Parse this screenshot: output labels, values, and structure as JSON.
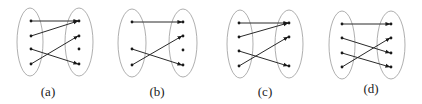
{
  "figure": {
    "width": 422,
    "height": 104,
    "colors": {
      "ellipse": "#9a9a9a",
      "edge": "#2a2a2a",
      "dot": "#1a1a1a",
      "label": "#222222"
    },
    "panels": [
      {
        "id": "a",
        "label": "(a)",
        "label_pos": [
          48,
          96
        ],
        "left_ellipse": {
          "cx": 30,
          "cy": 42,
          "rx": 13,
          "ry": 34
        },
        "right_ellipse": {
          "cx": 79,
          "cy": 42,
          "rx": 14,
          "ry": 34
        },
        "left_points": [
          [
            31,
            21
          ],
          [
            31,
            36
          ],
          [
            31,
            49
          ],
          [
            31,
            64
          ]
        ],
        "right_points": [
          [
            79,
            21
          ],
          [
            79,
            36
          ],
          [
            79,
            49
          ],
          [
            79,
            64
          ]
        ],
        "mapping": [
          [
            0,
            0
          ],
          [
            1,
            0
          ],
          [
            2,
            3
          ],
          [
            3,
            1
          ]
        ]
      },
      {
        "id": "b",
        "label": "(b)",
        "label_pos": [
          157,
          96
        ],
        "left_ellipse": {
          "cx": 132,
          "cy": 43,
          "rx": 14,
          "ry": 34
        },
        "right_ellipse": {
          "cx": 183,
          "cy": 43,
          "rx": 14,
          "ry": 34
        },
        "left_points": [
          [
            132,
            22
          ],
          [
            132,
            49
          ],
          [
            132,
            65
          ]
        ],
        "right_points": [
          [
            183,
            22
          ],
          [
            183,
            36
          ],
          [
            183,
            50
          ],
          [
            183,
            65
          ]
        ],
        "mapping": [
          [
            0,
            0
          ],
          [
            1,
            3
          ],
          [
            2,
            1
          ]
        ]
      },
      {
        "id": "c",
        "label": "(c)",
        "label_pos": [
          265,
          96
        ],
        "left_ellipse": {
          "cx": 240,
          "cy": 44,
          "rx": 13,
          "ry": 34
        },
        "right_ellipse": {
          "cx": 289,
          "cy": 44,
          "rx": 14,
          "ry": 34
        },
        "left_points": [
          [
            239,
            23
          ],
          [
            239,
            37
          ],
          [
            239,
            51
          ],
          [
            239,
            66
          ]
        ],
        "right_points": [
          [
            289,
            23
          ],
          [
            289,
            37
          ],
          [
            289,
            66
          ]
        ],
        "mapping": [
          [
            0,
            0
          ],
          [
            1,
            0
          ],
          [
            2,
            2
          ],
          [
            3,
            1
          ]
        ]
      },
      {
        "id": "d",
        "label": "(d)",
        "label_pos": [
          371,
          93
        ],
        "left_ellipse": {
          "cx": 342,
          "cy": 45,
          "rx": 13,
          "ry": 34
        },
        "right_ellipse": {
          "cx": 391,
          "cy": 45,
          "rx": 14,
          "ry": 34
        },
        "left_points": [
          [
            342,
            24
          ],
          [
            342,
            38
          ],
          [
            342,
            53
          ],
          [
            342,
            67
          ]
        ],
        "right_points": [
          [
            391,
            24
          ],
          [
            391,
            38
          ],
          [
            391,
            53
          ],
          [
            391,
            67
          ]
        ],
        "mapping": [
          [
            0,
            0
          ],
          [
            1,
            2
          ],
          [
            2,
            3
          ],
          [
            3,
            1
          ]
        ]
      }
    ]
  }
}
